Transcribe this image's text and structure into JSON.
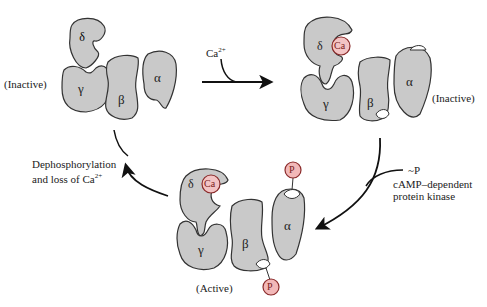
{
  "colors": {
    "subunit_fill": "#c9c9c9",
    "outline": "#333333",
    "ca_fill": "#f3c4c4",
    "ca_stroke": "#8a2a2a",
    "p_fill": "#f2b8b8"
  },
  "states": [
    {
      "id": "top-left",
      "label": "(Inactive)",
      "subunits": [
        "δ",
        "γ",
        "β",
        "α"
      ]
    },
    {
      "id": "top-right",
      "label": "(Inactive)",
      "subunits": [
        "δ",
        "γ",
        "β",
        "α"
      ],
      "bound": [
        "Ca"
      ]
    },
    {
      "id": "bottom",
      "label": "(Active)",
      "subunits": [
        "δ",
        "γ",
        "β",
        "α"
      ],
      "bound": [
        "Ca",
        "P",
        "P"
      ]
    }
  ],
  "arrows": {
    "calcium": {
      "label": "Ca",
      "sup": "2+"
    },
    "kinase": {
      "line1": "~P",
      "line2": "cAMP–dependent",
      "line3": "protein kinase"
    },
    "dephos": {
      "line1": "Dephosphorylation",
      "line2": "and loss of Ca",
      "sup": "2+"
    }
  },
  "glyphs": {
    "delta": "δ",
    "gamma": "γ",
    "beta": "β",
    "alpha": "α",
    "ca": "Ca",
    "p": "P"
  }
}
